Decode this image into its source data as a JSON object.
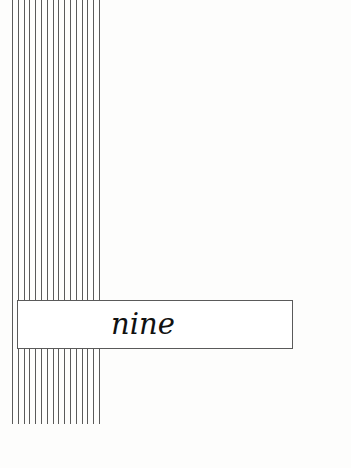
{
  "page": {
    "chapter_label": "nine"
  },
  "decoration": {
    "vertical_rules": {
      "count": 16,
      "start_x": 12,
      "spacing": 5.8,
      "top": 0,
      "bottom": 424,
      "color": "#5a5a5a"
    },
    "box_border_color": "#5a5a5a"
  }
}
